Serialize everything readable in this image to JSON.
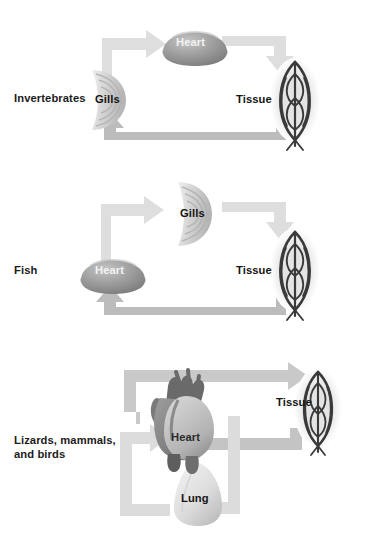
{
  "figure": {
    "type": "diagram",
    "background_color": "#ffffff",
    "palette": {
      "arrow_light": "#dcdcdc",
      "arrow_mid": "#bdbdbd",
      "arrow_dark": "#a8a8a8",
      "organ_gray": "#9a9a9a",
      "organ_light": "#d8d8d8",
      "tissue_dark": "#3a3a3a",
      "tissue_halo": "#e2e2e2",
      "text_dark": "#141414",
      "text_light": "#f2f2f2"
    }
  },
  "panels": [
    {
      "id": "invertebrates",
      "group_label": "Invertebrates",
      "organs": [
        {
          "name": "Heart",
          "icon": "heart-dome-icon",
          "label_color": "light"
        },
        {
          "name": "Gills",
          "icon": "gills-fan-icon",
          "label_color": "dark"
        },
        {
          "name": "Tissue",
          "icon": "tissue-leaf-icon",
          "label_color": "dark"
        }
      ],
      "flow": [
        {
          "from": "Gills",
          "to": "Heart",
          "shade": "light"
        },
        {
          "from": "Heart",
          "to": "Tissue",
          "shade": "light"
        },
        {
          "from": "Tissue",
          "to": "Gills",
          "shade": "mid"
        }
      ]
    },
    {
      "id": "fish",
      "group_label": "Fish",
      "organs": [
        {
          "name": "Gills",
          "icon": "gills-fan-icon",
          "label_color": "dark"
        },
        {
          "name": "Heart",
          "icon": "heart-dome-icon",
          "label_color": "light"
        },
        {
          "name": "Tissue",
          "icon": "tissue-leaf-icon",
          "label_color": "dark"
        }
      ],
      "flow": [
        {
          "from": "Heart",
          "to": "Gills",
          "shade": "light"
        },
        {
          "from": "Gills",
          "to": "Tissue",
          "shade": "light"
        },
        {
          "from": "Tissue",
          "to": "Heart",
          "shade": "mid"
        }
      ]
    },
    {
      "id": "amniotes",
      "group_label": "Lizards, mammals,\nand birds",
      "organs": [
        {
          "name": "Heart",
          "icon": "heart-anatomical-icon",
          "label_color": "dark"
        },
        {
          "name": "Lung",
          "icon": "lung-icon",
          "label_color": "dark"
        },
        {
          "name": "Tissue",
          "icon": "tissue-leaf-icon",
          "label_color": "dark"
        }
      ],
      "flow": [
        {
          "from": "Heart",
          "to": "Tissue",
          "shade": "mid"
        },
        {
          "from": "Tissue",
          "to": "Heart",
          "shade": "mid"
        },
        {
          "from": "Heart",
          "to": "Lung",
          "shade": "light"
        },
        {
          "from": "Lung",
          "to": "Heart",
          "shade": "light"
        }
      ]
    }
  ]
}
